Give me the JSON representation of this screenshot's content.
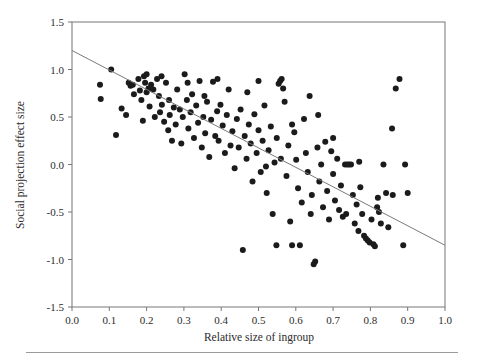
{
  "chart_data": {
    "type": "scatter",
    "title": "",
    "xlabel": "Relative size of ingroup",
    "ylabel": "Social projection effect size",
    "xlim": [
      0.0,
      1.0
    ],
    "ylim": [
      -1.5,
      1.5
    ],
    "xticks": [
      "0.0",
      "0.1",
      "0.2",
      "0.3",
      "0.4",
      "0.5",
      "0.6",
      "0.7",
      "0.8",
      "0.9",
      "1.0"
    ],
    "xtick_values": [
      0.0,
      0.1,
      0.2,
      0.3,
      0.4,
      0.5,
      0.6,
      0.7,
      0.8,
      0.9,
      1.0
    ],
    "yticks": [
      "1.5",
      "1.0",
      "0.5",
      "0.0",
      "-0.5",
      "-1.0",
      "-1.5"
    ],
    "ytick_values": [
      1.5,
      1.0,
      0.5,
      0.0,
      -0.5,
      -1.0,
      -1.5
    ],
    "grid": false,
    "legend": null,
    "marker": "filled-circle",
    "marker_color": "#1b1b1b",
    "marker_size": 3.0,
    "trendline": {
      "type": "linear",
      "color": "#7a7a7a",
      "x_start": 0.0,
      "y_start": 1.2,
      "x_end": 1.0,
      "y_end": -0.85,
      "slope": -2.05,
      "intercept": 1.2
    },
    "points": [
      [
        0.075,
        0.84
      ],
      [
        0.077,
        0.69
      ],
      [
        0.105,
        1.0
      ],
      [
        0.118,
        0.31
      ],
      [
        0.133,
        0.59
      ],
      [
        0.152,
        0.86
      ],
      [
        0.157,
        0.83
      ],
      [
        0.163,
        0.84
      ],
      [
        0.166,
        0.74
      ],
      [
        0.178,
        0.9
      ],
      [
        0.182,
        0.78
      ],
      [
        0.186,
        0.68
      ],
      [
        0.19,
        0.46
      ],
      [
        0.193,
        0.93
      ],
      [
        0.196,
        0.86
      ],
      [
        0.2,
        0.76
      ],
      [
        0.205,
        0.8
      ],
      [
        0.208,
        0.61
      ],
      [
        0.212,
        0.84
      ],
      [
        0.218,
        0.79
      ],
      [
        0.222,
        0.5
      ],
      [
        0.228,
        0.9
      ],
      [
        0.233,
        0.72
      ],
      [
        0.236,
        0.55
      ],
      [
        0.241,
        0.63
      ],
      [
        0.247,
        0.45
      ],
      [
        0.252,
        0.86
      ],
      [
        0.258,
        0.36
      ],
      [
        0.262,
        0.52
      ],
      [
        0.268,
        0.25
      ],
      [
        0.273,
        0.6
      ],
      [
        0.278,
        0.42
      ],
      [
        0.282,
        0.79
      ],
      [
        0.289,
        0.58
      ],
      [
        0.293,
        0.22
      ],
      [
        0.297,
        0.5
      ],
      [
        0.302,
        0.95
      ],
      [
        0.308,
        0.68
      ],
      [
        0.312,
        0.38
      ],
      [
        0.318,
        0.55
      ],
      [
        0.322,
        0.74
      ],
      [
        0.327,
        0.28
      ],
      [
        0.333,
        0.62
      ],
      [
        0.338,
        0.44
      ],
      [
        0.342,
        0.88
      ],
      [
        0.348,
        0.18
      ],
      [
        0.352,
        0.5
      ],
      [
        0.357,
        0.33
      ],
      [
        0.362,
        0.66
      ],
      [
        0.368,
        0.08
      ],
      [
        0.373,
        0.47
      ],
      [
        0.378,
        0.87
      ],
      [
        0.384,
        0.3
      ],
      [
        0.389,
        0.56
      ],
      [
        0.393,
        0.25
      ],
      [
        0.398,
        0.63
      ],
      [
        0.404,
        0.41
      ],
      [
        0.41,
        0.12
      ],
      [
        0.415,
        0.52
      ],
      [
        0.42,
        0.79
      ],
      [
        0.425,
        0.2
      ],
      [
        0.43,
        0.35
      ],
      [
        0.436,
        -0.04
      ],
      [
        0.442,
        0.48
      ],
      [
        0.447,
        0.18
      ],
      [
        0.452,
        0.58
      ],
      [
        0.458,
        -0.9
      ],
      [
        0.463,
        0.3
      ],
      [
        0.468,
        0.06
      ],
      [
        0.474,
        0.42
      ],
      [
        0.479,
        0.22
      ],
      [
        0.484,
        -0.18
      ],
      [
        0.489,
        0.53
      ],
      [
        0.495,
        0.12
      ],
      [
        0.5,
        0.36
      ],
      [
        0.506,
        -0.08
      ],
      [
        0.511,
        0.25
      ],
      [
        0.516,
        0.62
      ],
      [
        0.522,
        -0.3
      ],
      [
        0.527,
        0.15
      ],
      [
        0.533,
        0.4
      ],
      [
        0.538,
        -0.52
      ],
      [
        0.543,
        0.02
      ],
      [
        0.549,
        0.28
      ],
      [
        0.554,
        0.85
      ],
      [
        0.558,
        0.88
      ],
      [
        0.562,
        0.9
      ],
      [
        0.566,
        0.8
      ],
      [
        0.57,
        0.66
      ],
      [
        0.575,
        -0.12
      ],
      [
        0.58,
        0.2
      ],
      [
        0.585,
        -0.6
      ],
      [
        0.59,
        -0.85
      ],
      [
        0.596,
        0.34
      ],
      [
        0.601,
        0.05
      ],
      [
        0.606,
        -0.25
      ],
      [
        0.611,
        -0.85
      ],
      [
        0.616,
        -0.4
      ],
      [
        0.622,
        0.48
      ],
      [
        0.627,
        0.12
      ],
      [
        0.632,
        -0.08
      ],
      [
        0.637,
        0.72
      ],
      [
        0.643,
        -0.32
      ],
      [
        0.648,
        -1.05
      ],
      [
        0.652,
        -1.02
      ],
      [
        0.658,
        0.18
      ],
      [
        0.663,
        -0.18
      ],
      [
        0.668,
        0.0
      ],
      [
        0.673,
        -0.45
      ],
      [
        0.679,
        0.24
      ],
      [
        0.684,
        -0.28
      ],
      [
        0.689,
        -0.58
      ],
      [
        0.695,
        0.14
      ],
      [
        0.7,
        -0.1
      ],
      [
        0.705,
        -0.38
      ],
      [
        0.711,
        0.06
      ],
      [
        0.716,
        -0.48
      ],
      [
        0.721,
        -0.22
      ],
      [
        0.726,
        -0.55
      ],
      [
        0.732,
        0.0
      ],
      [
        0.738,
        0.0
      ],
      [
        0.743,
        0.0
      ],
      [
        0.748,
        0.0
      ],
      [
        0.753,
        -0.32
      ],
      [
        0.758,
        -0.62
      ],
      [
        0.763,
        -0.42
      ],
      [
        0.768,
        -0.7
      ],
      [
        0.773,
        -0.24
      ],
      [
        0.778,
        -0.52
      ],
      [
        0.783,
        -0.75
      ],
      [
        0.788,
        -0.78
      ],
      [
        0.793,
        -0.8
      ],
      [
        0.798,
        -0.82
      ],
      [
        0.803,
        -0.58
      ],
      [
        0.808,
        -0.84
      ],
      [
        0.812,
        -0.86
      ],
      [
        0.818,
        -0.45
      ],
      [
        0.823,
        -0.5
      ],
      [
        0.828,
        -0.62
      ],
      [
        0.835,
        0.0
      ],
      [
        0.842,
        -0.3
      ],
      [
        0.848,
        -0.66
      ],
      [
        0.858,
        0.38
      ],
      [
        0.868,
        0.8
      ],
      [
        0.878,
        0.9
      ],
      [
        0.888,
        -0.85
      ],
      [
        0.893,
        0.0
      ],
      [
        0.9,
        -0.3
      ],
      [
        0.56,
        0.06
      ],
      [
        0.548,
        -0.85
      ],
      [
        0.64,
        -0.52
      ],
      [
        0.31,
        0.86
      ],
      [
        0.24,
        0.93
      ],
      [
        0.26,
        0.68
      ],
      [
        0.2,
        0.95
      ],
      [
        0.145,
        0.52
      ],
      [
        0.355,
        0.72
      ],
      [
        0.39,
        0.9
      ],
      [
        0.47,
        0.76
      ],
      [
        0.5,
        0.88
      ],
      [
        0.52,
        -0.02
      ],
      [
        0.59,
        0.42
      ],
      [
        0.66,
        0.52
      ],
      [
        0.7,
        0.28
      ],
      [
        0.82,
        -0.35
      ],
      [
        0.86,
        -0.32
      ],
      [
        0.77,
        0.03
      ],
      [
        0.735,
        -0.52
      ]
    ]
  },
  "axis": {
    "y_title": "Social projection effect size",
    "x_title": "Relative size of ingroup"
  }
}
